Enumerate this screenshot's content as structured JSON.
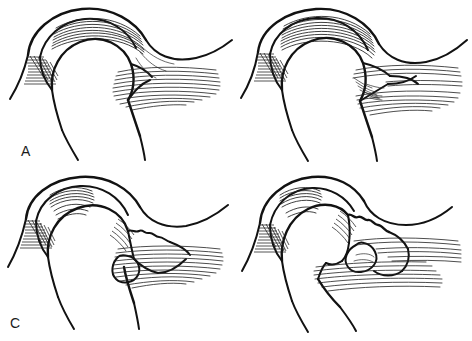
{
  "figure": {
    "background_color": "#ffffff",
    "ink_color": "#121212",
    "width": 472,
    "height": 341,
    "style": "black-and-white medical line art, hatched fiber shading"
  },
  "panels": [
    {
      "id": "a",
      "label": "A",
      "caption": "Normal intact supraspinatus tendon and rotator cuff insertion on the greater tuberosity of the humeral head",
      "stage": "Stage 1 - Normal anatomy",
      "features": [
        "intact acromion",
        "intact supraspinatus tendon fibers",
        "smooth humeral head contour",
        "normal subacromial space",
        "deltoid muscle fibers"
      ]
    },
    {
      "id": "b",
      "label": "B",
      "caption": "Partial-thickness articular-sided tear with early fiber disruption at the tendon insertion",
      "stage": "Stage 2 - Partial tear",
      "features": [
        "frayed tendon edge",
        "partial fiber disruption",
        "small articular-side defect",
        "preserved humeral head contour"
      ]
    },
    {
      "id": "c",
      "label": "C",
      "caption": "Full-thickness tear with tendon retraction and early irregularity of the greater tuberosity",
      "stage": "Stage 3 - Full-thickness tear",
      "features": [
        "retracted tendon stump",
        "full-thickness defect",
        "irregular tuberosity surface",
        "rounded retracted tendon end"
      ]
    },
    {
      "id": "d",
      "label": "D",
      "caption": "Massive retracted tear with superior migration of the humeral head and degenerative tuberosity erosion",
      "stage": "Stage 4 - Massive tear with cuff arthropathy",
      "features": [
        "markedly irregular eroded tuberosity",
        "superior humeral head migration",
        "loss of subacromial space",
        "widely retracted tendon"
      ]
    }
  ]
}
